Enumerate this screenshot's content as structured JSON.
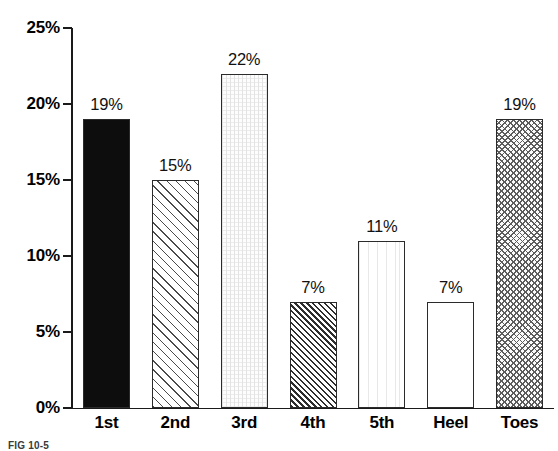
{
  "chart_data": {
    "type": "bar",
    "title": "",
    "subtitle": "",
    "xlabel": "",
    "ylabel": "",
    "categories": [
      "1st",
      "2nd",
      "3rd",
      "4th",
      "5th",
      "Heel",
      "Toes"
    ],
    "values": [
      19,
      15,
      22,
      7,
      11,
      7,
      19
    ],
    "value_labels": [
      "19%",
      "15%",
      "22%",
      "7%",
      "11%",
      "7%",
      "19%"
    ],
    "ylim": [
      0,
      25
    ],
    "ytick_values": [
      0,
      5,
      10,
      15,
      20,
      25
    ],
    "ytick_labels": [
      "0%",
      "5%",
      "10%",
      "15%",
      "20%",
      "25%"
    ],
    "grid": false,
    "legend": false,
    "legend_position": "none",
    "bar_patterns": [
      "solid-black",
      "diagonal-hatch-light",
      "fine-dot-grid-faint",
      "diagonal-hatch-dense",
      "vertical-lines-faint",
      "plain-white",
      "crosshatch-gray"
    ],
    "annotations": []
  },
  "figure": {
    "caption": "FIG 10-5"
  },
  "colors": {
    "axis": "#1a1a1a",
    "bar_outline": "#2b2b2b",
    "text": "#000000",
    "background": "#ffffff"
  }
}
